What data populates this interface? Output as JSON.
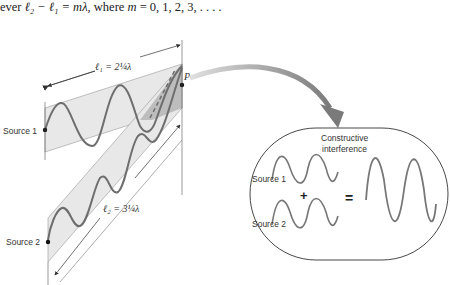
{
  "caption": {
    "prefix": "ever",
    "equation": "ℓ₂ − ℓ₁ = mλ,",
    "middle": "where",
    "var": "m",
    "values": "= 0, 1, 2, 3,  .  .  .  ."
  },
  "diagram": {
    "source1_label": "Source 1",
    "source2_label": "Source 2",
    "point_label": "P",
    "l1_label": "ℓ₁ = 2¼λ",
    "l2_label": "ℓ₂ = 3¼λ",
    "band_fill": "#e6e6e6",
    "overlap_fill": "#b5b5b5",
    "wave_color": "#6e6e6e",
    "arrow_color": "#8a8a8a"
  },
  "inset": {
    "title_line1": "Constructive",
    "title_line2": "interference",
    "source1_label": "Source 1",
    "source2_label": "Source 2",
    "plus": "+",
    "equals": "="
  }
}
